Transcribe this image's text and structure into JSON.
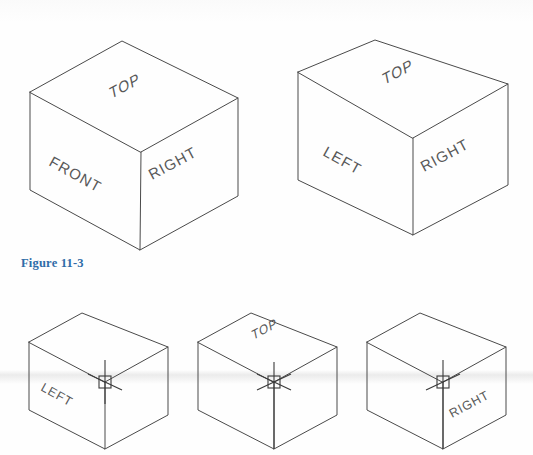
{
  "figure": {
    "caption": "Figure 11-3"
  },
  "theme": {
    "background_color": "#fefefe",
    "line_color": "#4a4a4a",
    "label_color": "#585858",
    "caption_color": "#2f6ca8",
    "cursor_color": "#3a3a3a"
  },
  "cursor": {
    "name": "crosshair-pickbox-cursor",
    "description": "AutoCAD isometric crosshair with square pick box"
  },
  "cubes": {
    "top_row": [
      {
        "id": "cube-front-right",
        "position": "top-left",
        "has_cursor": false,
        "labels": {
          "top": "TOP",
          "left": "FRONT",
          "right": "RIGHT"
        }
      },
      {
        "id": "cube-left-right",
        "position": "top-right",
        "has_cursor": false,
        "labels": {
          "top": "TOP",
          "left": "LEFT",
          "right": "RIGHT"
        }
      }
    ],
    "bottom_row": [
      {
        "id": "cube-isoplane-left",
        "position": "bottom-left",
        "has_cursor": true,
        "labels": {
          "left": "LEFT"
        }
      },
      {
        "id": "cube-isoplane-top",
        "position": "bottom-center",
        "has_cursor": true,
        "labels": {
          "top": "TOP"
        }
      },
      {
        "id": "cube-isoplane-right",
        "position": "bottom-right",
        "has_cursor": true,
        "labels": {
          "right": "RIGHT"
        }
      }
    ]
  }
}
